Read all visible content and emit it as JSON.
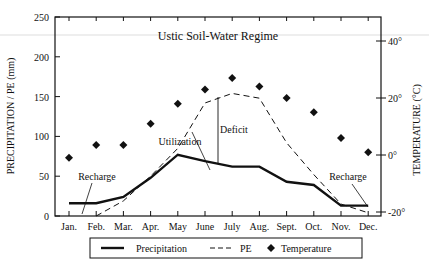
{
  "chart_data": {
    "type": "line",
    "title": "Ustic Soil-Water Regime",
    "xlabel": "",
    "ylabel": "PRECIPITATION / PE (mm)",
    "ylabel_right": "TEMPERATURE (°C)",
    "ylim": [
      0,
      250
    ],
    "ylim_right": [
      -20,
      50
    ],
    "categories": [
      "Jan.",
      "Feb.",
      "Mar.",
      "Apr.",
      "May",
      "June",
      "July",
      "Aug.",
      "Sept.",
      "Oct.",
      "Nov.",
      "Dec."
    ],
    "y_ticks": [
      "0",
      "50",
      "100",
      "150",
      "200",
      "250"
    ],
    "y_ticks_right": [
      "-20°",
      "0°",
      "20°",
      "40°"
    ],
    "series": [
      {
        "name": "Precipitation",
        "style": "solid",
        "axis": "left",
        "values": [
          16,
          16,
          24,
          48,
          77,
          69,
          62,
          62,
          43,
          39,
          13,
          13
        ]
      },
      {
        "name": "PE",
        "style": "dashed",
        "axis": "left",
        "values": [
          null,
          0,
          19,
          50,
          85,
          142,
          154,
          148,
          92,
          52,
          15,
          4
        ]
      },
      {
        "name": "Temperature",
        "style": "diamond-markers",
        "axis": "right",
        "values": [
          -1,
          3.5,
          3.5,
          11,
          18,
          23,
          27,
          24,
          20,
          15,
          6,
          1
        ]
      }
    ],
    "annotations": [
      "Recharge",
      "Utilization",
      "Deficit",
      "Recharge"
    ],
    "legend": {
      "position": "bottom",
      "entries": [
        "Precipitation",
        "PE",
        "Temperature"
      ]
    },
    "grid": false
  }
}
